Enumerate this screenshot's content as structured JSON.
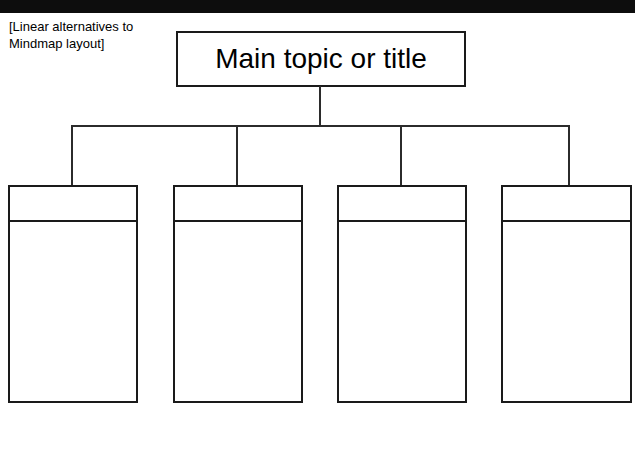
{
  "page": {
    "title": "Linear alternatives to Mindmap layout",
    "background_color": "#ffffff",
    "line_color": "#1a1a1a",
    "header_bar_color": "#0d0d0d"
  },
  "header": {
    "bar_label": ""
  },
  "caption": {
    "text": "[Linear alternatives to\nMindmap layout]"
  },
  "diagram": {
    "type": "tree-org-chart",
    "root": {
      "label": "Main topic or title"
    },
    "children": [
      {
        "head": "",
        "body": ""
      },
      {
        "head": "",
        "body": ""
      },
      {
        "head": "",
        "body": ""
      },
      {
        "head": "",
        "body": ""
      }
    ]
  }
}
